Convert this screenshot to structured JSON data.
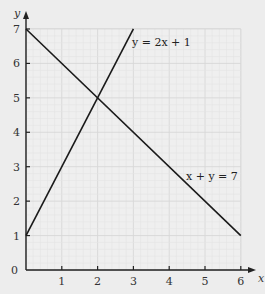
{
  "chart_data": {
    "type": "line",
    "title": "",
    "xlabel": "x",
    "ylabel": "y",
    "xlim": [
      0,
      6
    ],
    "ylim": [
      0,
      7
    ],
    "grid": true,
    "x_ticks": [
      "1",
      "2",
      "3",
      "4",
      "5",
      "6"
    ],
    "y_ticks": [
      "1",
      "2",
      "3",
      "4",
      "5",
      "6",
      "7"
    ],
    "origin_label": "0",
    "series": [
      {
        "name": "y = 2x + 1",
        "x": [
          0,
          3
        ],
        "y": [
          1,
          7
        ],
        "label": "y = 2x + 1"
      },
      {
        "name": "x + y = 7",
        "x": [
          0,
          6
        ],
        "y": [
          7,
          1
        ],
        "label": "x + y = 7"
      }
    ],
    "annotations": [
      {
        "text": "y = 2x + 1",
        "near": [
          3.1,
          6.7
        ]
      },
      {
        "text": "x + y = 7",
        "near": [
          4.6,
          3.0
        ]
      }
    ],
    "intersection": [
      2,
      5
    ]
  }
}
